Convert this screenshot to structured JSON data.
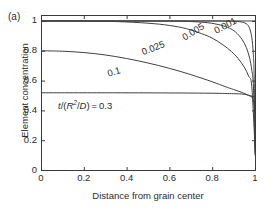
{
  "panel": {
    "label": "(a)"
  },
  "chart_data": {
    "type": "line",
    "title": "",
    "subtitle": "",
    "xlabel": "Distance from grain center",
    "ylabel": "Element concentration",
    "xlim": [
      0,
      1
    ],
    "ylim": [
      0,
      1.04
    ],
    "grid": false,
    "legend_position": "inline-curve-labels",
    "xticks": [
      "0",
      "0.2",
      "0.4",
      "0.6",
      "0.8",
      "1"
    ],
    "xtick_values": [
      0,
      0.2,
      0.4,
      0.6,
      0.8,
      1
    ],
    "yticks": [
      "0",
      "0.2",
      "0.4",
      "0.6",
      "0.8",
      "1"
    ],
    "ytick_values": [
      0,
      0.2,
      0.4,
      0.6,
      0.8,
      1
    ],
    "annotation": {
      "text": "t/(R2/D) = 0.3",
      "numerator": "t",
      "denominator_base": "R",
      "denominator_exp": "2",
      "denominator_div": "D",
      "value": "0.3"
    },
    "series": [
      {
        "name": "0.001",
        "label": "0.001",
        "label_rotation": -28,
        "x": [
          0,
          0.5,
          0.7,
          0.8,
          0.86,
          0.9,
          0.93,
          0.95,
          0.965,
          0.975,
          0.985,
          0.992,
          0.996,
          1
        ],
        "y": [
          1.0,
          1.0,
          1.0,
          1.0,
          0.999,
          0.998,
          0.995,
          0.988,
          0.975,
          0.95,
          0.89,
          0.78,
          0.63,
          0.1
        ]
      },
      {
        "name": "0.005",
        "label": "0.005",
        "label_rotation": -32,
        "x": [
          0,
          0.4,
          0.6,
          0.7,
          0.78,
          0.84,
          0.88,
          0.91,
          0.94,
          0.96,
          0.975,
          0.985,
          0.993,
          1
        ],
        "y": [
          1.0,
          1.0,
          0.999,
          0.996,
          0.988,
          0.972,
          0.952,
          0.925,
          0.875,
          0.82,
          0.75,
          0.67,
          0.55,
          0.12
        ]
      },
      {
        "name": "0.025",
        "label": "0.025",
        "label_rotation": -22,
        "x": [
          0,
          0.2,
          0.35,
          0.5,
          0.6,
          0.68,
          0.75,
          0.8,
          0.85,
          0.89,
          0.92,
          0.95,
          0.97,
          0.985,
          1
        ],
        "y": [
          1.0,
          0.999,
          0.996,
          0.985,
          0.97,
          0.948,
          0.915,
          0.885,
          0.84,
          0.795,
          0.75,
          0.69,
          0.63,
          0.56,
          0.15
        ]
      },
      {
        "name": "0.1",
        "label": "0.1",
        "label_rotation": -16,
        "x": [
          0,
          0.1,
          0.2,
          0.3,
          0.4,
          0.5,
          0.6,
          0.7,
          0.8,
          0.86,
          0.9,
          0.94,
          0.97,
          0.99,
          1
        ],
        "y": [
          0.8,
          0.797,
          0.788,
          0.772,
          0.748,
          0.718,
          0.682,
          0.64,
          0.592,
          0.56,
          0.54,
          0.52,
          0.5,
          0.48,
          0.4
        ]
      },
      {
        "name": "0.3",
        "label": "0.3",
        "is_annotation_line": true,
        "x": [
          0,
          0.3,
          0.6,
          0.8,
          0.9,
          0.95,
          1
        ],
        "y": [
          0.518,
          0.518,
          0.517,
          0.515,
          0.512,
          0.508,
          0.49
        ]
      },
      {
        "name": "top-reference-line",
        "label": "",
        "x": [
          0,
          1
        ],
        "y": [
          1.0,
          1.0
        ]
      }
    ]
  }
}
